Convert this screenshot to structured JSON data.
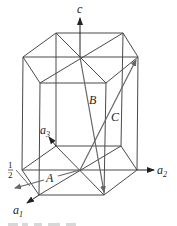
{
  "diagram": {
    "axes": {
      "c": "c",
      "a1": "a",
      "a1_sub": "1",
      "a2": "a",
      "a2_sub": "2",
      "a3": "a",
      "a3_sub": "3"
    },
    "vectors": {
      "A": "A",
      "B": "B",
      "C": "C"
    },
    "fraction": {
      "numerator": "1",
      "denominator": "2"
    },
    "colors": {
      "edge": "#4a4a4a",
      "vector": "#666666",
      "axis": "#222222"
    }
  }
}
